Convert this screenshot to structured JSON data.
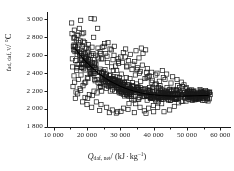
{
  "figure": {
    "name": "scatter-plot-adiabatic-temperature-vs-net-calorific-value",
    "background": "#ffffff",
    "foreground": "#1a1a1a"
  },
  "axis_titles": {
    "x_symbol": "Q",
    "x_subscript": "daf, net",
    "x_separator": "/ (kJ",
    "x_middot": "·",
    "x_unit": "kg",
    "x_unit_exponent": "−1",
    "x_close": ")",
    "x_full": "Q_daf, net / (kJ · kg−1)",
    "y_symbol": "t",
    "y_subscript": "ad, daf, V",
    "y_separator": "/",
    "y_unit": "°C",
    "y_full": "t_ad, daf, V / °C"
  },
  "chart_data": {
    "type": "scatter",
    "title": "",
    "xlabel": "Q_daf, net / (kJ · kg−1)",
    "ylabel": "t_ad, daf, V / °C",
    "xlim": [
      8000,
      62000
    ],
    "ylim": [
      1800,
      3060
    ],
    "xticks": [
      10000,
      20000,
      30000,
      40000,
      50000,
      60000
    ],
    "xticklabels": [
      "10 000",
      "20 000",
      "30 000",
      "40 000",
      "50 000",
      "60 000"
    ],
    "yticks": [
      1800,
      2000,
      2200,
      2400,
      2600,
      2800,
      3000
    ],
    "yticklabels": [
      "1 800",
      "2 000",
      "2 200",
      "2 400",
      "2 600",
      "2 800",
      "3 000"
    ],
    "x_minor_tick_count": 1,
    "y_minor_tick_count": 0,
    "grid": false,
    "legend": false,
    "spines": [
      "left",
      "bottom"
    ],
    "tick_direction": "out",
    "marker": {
      "shape": "square",
      "filled": false,
      "edgecolor": "#1a1a1a",
      "facecolor": "none",
      "size_px": 4.2,
      "linewidth": 0.7
    },
    "series": [
      {
        "name": "measured samples",
        "marker": "open-square",
        "points": [
          [
            15400,
            2960
          ],
          [
            16200,
            2880
          ],
          [
            16050,
            2790
          ],
          [
            16800,
            2770
          ],
          [
            17300,
            2820
          ],
          [
            15900,
            2700
          ],
          [
            16400,
            2640
          ],
          [
            17100,
            2680
          ],
          [
            18000,
            2760
          ],
          [
            18600,
            2700
          ],
          [
            17800,
            2600
          ],
          [
            16600,
            2540
          ],
          [
            15700,
            2470
          ],
          [
            16900,
            2430
          ],
          [
            17600,
            2500
          ],
          [
            18300,
            2560
          ],
          [
            19100,
            2620
          ],
          [
            19800,
            2680
          ],
          [
            20400,
            2720
          ],
          [
            21200,
            3010
          ],
          [
            22000,
            2800
          ],
          [
            21500,
            2690
          ],
          [
            20800,
            2600
          ],
          [
            19500,
            2520
          ],
          [
            18900,
            2450
          ],
          [
            18200,
            2380
          ],
          [
            17400,
            2330
          ],
          [
            16300,
            2300
          ],
          [
            15800,
            2250
          ],
          [
            16700,
            2190
          ],
          [
            17900,
            2230
          ],
          [
            19200,
            2290
          ],
          [
            20100,
            2350
          ],
          [
            20900,
            2400
          ],
          [
            21700,
            2460
          ],
          [
            22400,
            2520
          ],
          [
            23100,
            2580
          ],
          [
            23900,
            2640
          ],
          [
            24600,
            2690
          ],
          [
            25300,
            2730
          ],
          [
            24100,
            2620
          ],
          [
            23400,
            2560
          ],
          [
            22700,
            2500
          ],
          [
            21900,
            2440
          ],
          [
            21100,
            2390
          ],
          [
            20300,
            2340
          ],
          [
            19600,
            2300
          ],
          [
            18800,
            2260
          ],
          [
            18100,
            2210
          ],
          [
            17200,
            2170
          ],
          [
            19400,
            2130
          ],
          [
            20700,
            2160
          ],
          [
            22100,
            2200
          ],
          [
            23600,
            2240
          ],
          [
            25000,
            2280
          ],
          [
            26400,
            2330
          ],
          [
            27100,
            2380
          ],
          [
            27900,
            2430
          ],
          [
            28600,
            2480
          ],
          [
            29400,
            2530
          ],
          [
            30100,
            2580
          ],
          [
            30900,
            2630
          ],
          [
            31600,
            2670
          ],
          [
            28200,
            2700
          ],
          [
            26900,
            2670
          ],
          [
            25600,
            2620
          ],
          [
            24800,
            2560
          ],
          [
            26100,
            2520
          ],
          [
            27400,
            2470
          ],
          [
            28900,
            2430
          ],
          [
            30300,
            2390
          ],
          [
            31800,
            2350
          ],
          [
            29700,
            2320
          ],
          [
            28400,
            2290
          ],
          [
            27000,
            2260
          ],
          [
            25800,
            2230
          ],
          [
            24400,
            2200
          ],
          [
            23000,
            2180
          ],
          [
            21600,
            2150
          ],
          [
            20200,
            2120
          ],
          [
            22800,
            2080
          ],
          [
            24200,
            2050
          ],
          [
            25900,
            2020
          ],
          [
            27600,
            1990
          ],
          [
            29200,
            1970
          ],
          [
            31000,
            2010
          ],
          [
            32600,
            2060
          ],
          [
            34100,
            2100
          ],
          [
            33300,
            2140
          ],
          [
            32100,
            2180
          ],
          [
            30700,
            2220
          ],
          [
            29900,
            2260
          ],
          [
            31300,
            2300
          ],
          [
            32900,
            2340
          ],
          [
            34500,
            2380
          ],
          [
            36000,
            2420
          ],
          [
            35200,
            2460
          ],
          [
            33800,
            2500
          ],
          [
            32400,
            2540
          ],
          [
            31500,
            2580
          ],
          [
            33000,
            2610
          ],
          [
            34700,
            2650
          ],
          [
            36300,
            2680
          ],
          [
            37600,
            2660
          ],
          [
            36800,
            2620
          ],
          [
            35600,
            2570
          ],
          [
            34300,
            2530
          ],
          [
            36600,
            2490
          ],
          [
            38100,
            2450
          ],
          [
            39400,
            2410
          ],
          [
            38700,
            2370
          ],
          [
            37400,
            2340
          ],
          [
            36100,
            2310
          ],
          [
            34900,
            2280
          ],
          [
            33600,
            2250
          ],
          [
            35400,
            2220
          ],
          [
            37100,
            2190
          ],
          [
            38900,
            2160
          ],
          [
            40200,
            2200
          ],
          [
            41500,
            2240
          ],
          [
            40800,
            2280
          ],
          [
            39600,
            2320
          ],
          [
            38300,
            2360
          ],
          [
            41000,
            2400
          ],
          [
            42600,
            2430
          ],
          [
            43900,
            2390
          ],
          [
            42900,
            2350
          ],
          [
            41700,
            2310
          ],
          [
            40400,
            2270
          ],
          [
            42100,
            2230
          ],
          [
            43700,
            2200
          ],
          [
            45000,
            2170
          ],
          [
            44200,
            2140
          ],
          [
            42800,
            2110
          ],
          [
            41400,
            2080
          ],
          [
            39900,
            2040
          ],
          [
            38500,
            2010
          ],
          [
            37200,
            1980
          ],
          [
            35900,
            2020
          ],
          [
            34600,
            2060
          ],
          [
            43100,
            1970
          ],
          [
            44800,
            1990
          ],
          [
            46200,
            2030
          ],
          [
            47500,
            2070
          ],
          [
            46800,
            2110
          ],
          [
            45500,
            2150
          ],
          [
            44100,
            2180
          ],
          [
            46000,
            2210
          ],
          [
            47800,
            2240
          ],
          [
            49100,
            2270
          ],
          [
            48300,
            2300
          ],
          [
            47000,
            2330
          ],
          [
            45700,
            2360
          ],
          [
            48700,
            2250
          ],
          [
            50200,
            2200
          ],
          [
            51500,
            2170
          ],
          [
            52800,
            2160
          ],
          [
            54100,
            2155
          ],
          [
            55400,
            2150
          ],
          [
            56200,
            2150
          ],
          [
            53400,
            2180
          ],
          [
            51900,
            2190
          ],
          [
            50700,
            2210
          ],
          [
            49500,
            2230
          ],
          [
            23200,
            2900
          ],
          [
            19000,
            2850
          ],
          [
            17000,
            2460
          ],
          [
            16100,
            2370
          ],
          [
            20600,
            2470
          ],
          [
            25400,
            2440
          ],
          [
            28000,
            2360
          ],
          [
            30500,
            2300
          ],
          [
            33100,
            2230
          ],
          [
            36400,
            2170
          ],
          [
            39100,
            2130
          ],
          [
            22300,
            2330
          ],
          [
            24900,
            2310
          ],
          [
            26600,
            2290
          ],
          [
            29000,
            2240
          ],
          [
            31200,
            2210
          ],
          [
            18400,
            2620
          ],
          [
            19700,
            2580
          ],
          [
            21000,
            2550
          ],
          [
            22600,
            2600
          ],
          [
            24300,
            2560
          ],
          [
            26000,
            2590
          ],
          [
            27800,
            2550
          ],
          [
            29500,
            2510
          ],
          [
            31900,
            2470
          ],
          [
            35000,
            2440
          ],
          [
            37900,
            2410
          ],
          [
            40600,
            2380
          ],
          [
            43400,
            2330
          ],
          [
            45200,
            2290
          ],
          [
            47200,
            2260
          ],
          [
            49800,
            2240
          ],
          [
            16500,
            2120
          ],
          [
            18700,
            2080
          ],
          [
            20000,
            2050
          ],
          [
            21400,
            2020
          ],
          [
            23800,
            1985
          ],
          [
            26700,
            1960
          ],
          [
            28800,
            1955
          ],
          [
            30200,
            1975
          ],
          [
            32300,
            1995
          ],
          [
            34200,
            1960
          ],
          [
            37700,
            1950
          ],
          [
            40000,
            1970
          ],
          [
            41200,
            2020
          ],
          [
            42400,
            2060
          ],
          [
            44500,
            2100
          ],
          [
            46500,
            2130
          ],
          [
            15600,
            2560
          ],
          [
            16000,
            2660
          ],
          [
            17500,
            2740
          ],
          [
            18500,
            2840
          ],
          [
            19300,
            2740
          ],
          [
            20500,
            2660
          ],
          [
            21800,
            2620
          ],
          [
            23300,
            2680
          ],
          [
            25100,
            2700
          ],
          [
            26300,
            2740
          ],
          [
            27300,
            2660
          ],
          [
            28100,
            2600
          ],
          [
            29300,
            2560
          ],
          [
            30600,
            2520
          ],
          [
            32000,
            2480
          ],
          [
            33500,
            2440
          ],
          [
            35700,
            2400
          ],
          [
            38000,
            2350
          ],
          [
            39300,
            2300
          ],
          [
            41900,
            2260
          ],
          [
            44000,
            2240
          ],
          [
            45900,
            2220
          ],
          [
            48000,
            2190
          ],
          [
            50400,
            2170
          ],
          [
            52000,
            2165
          ],
          [
            53700,
            2160
          ],
          [
            55000,
            2155
          ],
          [
            56000,
            2148
          ],
          [
            17700,
            2900
          ],
          [
            15500,
            2840
          ],
          [
            18100,
            2990
          ],
          [
            22200,
            3005
          ]
        ]
      }
    ],
    "fit_curve": {
      "name": "fitted regression curve",
      "style": "solid",
      "color": "#000000",
      "linewidth": 1.1,
      "points": [
        [
          16500,
          2672
        ],
        [
          18000,
          2600
        ],
        [
          19500,
          2535
        ],
        [
          21000,
          2478
        ],
        [
          22500,
          2428
        ],
        [
          24000,
          2384
        ],
        [
          25500,
          2345
        ],
        [
          27000,
          2311
        ],
        [
          28500,
          2281
        ],
        [
          30000,
          2255
        ],
        [
          31500,
          2232
        ],
        [
          33000,
          2213
        ],
        [
          34500,
          2196
        ],
        [
          36000,
          2182
        ],
        [
          37500,
          2171
        ],
        [
          39000,
          2162
        ],
        [
          40500,
          2156
        ],
        [
          42000,
          2151
        ],
        [
          43500,
          2148
        ],
        [
          45000,
          2146
        ],
        [
          46500,
          2145
        ],
        [
          48000,
          2145
        ],
        [
          49500,
          2146
        ],
        [
          51000,
          2147
        ],
        [
          52500,
          2149
        ],
        [
          54000,
          2150
        ],
        [
          55500,
          2152
        ],
        [
          56500,
          2153
        ]
      ]
    }
  }
}
